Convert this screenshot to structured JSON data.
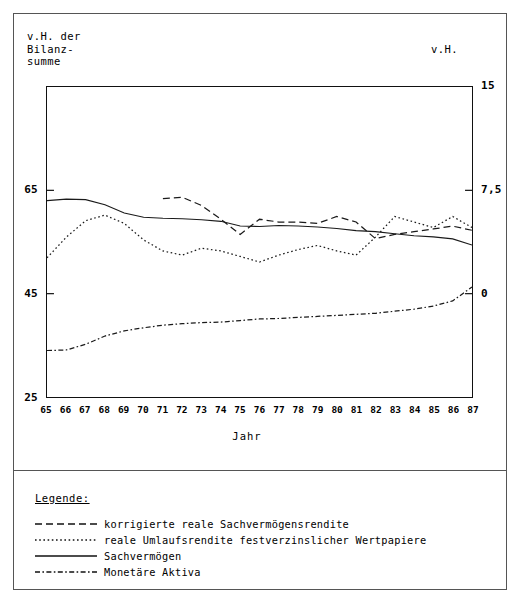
{
  "figure": {
    "left_axis_caption": "v.H. der\nBilanz-\nsumme",
    "right_axis_caption": "v.H."
  },
  "legend": {
    "title": "Legende:",
    "entries": [
      {
        "label": "korrigierte reale Sachvermögensrendite",
        "style": "dashed"
      },
      {
        "label": "reale Umlaufsrendite festverzinslicher Wertpapiere",
        "style": "dotted"
      },
      {
        "label": "Sachvermögen",
        "style": "solid"
      },
      {
        "label": "Monetäre Aktiva",
        "style": "dashdot"
      }
    ]
  },
  "chart_data": {
    "type": "line",
    "title": "",
    "xlabel": "Jahr",
    "ylabel": "v.H. der Bilanzsumme",
    "y2label": "v.H.",
    "grid": false,
    "legend_position": "below-plot",
    "x": [
      65,
      66,
      67,
      68,
      69,
      70,
      71,
      72,
      73,
      74,
      75,
      76,
      77,
      78,
      79,
      80,
      81,
      82,
      83,
      84,
      85,
      86,
      87
    ],
    "xtick_labels": [
      "65",
      "66",
      "67",
      "68",
      "69",
      "70",
      "71",
      "72",
      "73",
      "74",
      "75",
      "76",
      "77",
      "78",
      "79",
      "80",
      "81",
      "82",
      "83",
      "84",
      "85",
      "86",
      "87"
    ],
    "ylim": [
      25,
      85
    ],
    "yticks": [
      25,
      45,
      65,
      85
    ],
    "ytick_labels": [
      "25",
      "45",
      "65",
      ""
    ],
    "y2lim": [
      -7.5,
      15
    ],
    "y2ticks": [
      0,
      7.5,
      15
    ],
    "y2tick_labels": [
      "0",
      "7,5",
      "15"
    ],
    "series": [
      {
        "name": "korrigierte reale Sachvermögensrendite",
        "style": "dashed",
        "axis": "right",
        "x": [
          71,
          72,
          73,
          74,
          75,
          76,
          77,
          78,
          79,
          80,
          81,
          82,
          83,
          84,
          85,
          86,
          87
        ],
        "values": [
          6.9,
          7.0,
          6.4,
          5.4,
          4.3,
          5.4,
          5.2,
          5.2,
          5.1,
          5.6,
          5.2,
          4.0,
          4.3,
          4.5,
          4.7,
          4.9,
          4.6
        ]
      },
      {
        "name": "reale Umlaufsrendite festverzinslicher Wertpapiere",
        "style": "dotted",
        "axis": "right",
        "x": [
          65,
          66,
          67,
          68,
          69,
          70,
          71,
          72,
          73,
          74,
          75,
          76,
          77,
          78,
          79,
          80,
          81,
          82,
          83,
          84,
          85,
          86,
          87
        ],
        "values": [
          2.6,
          4.1,
          5.3,
          5.7,
          5.1,
          3.9,
          3.1,
          2.8,
          3.3,
          3.1,
          2.7,
          2.3,
          2.8,
          3.2,
          3.5,
          3.1,
          2.8,
          4.1,
          5.6,
          5.2,
          4.8,
          5.6,
          4.8
        ]
      },
      {
        "name": "Sachvermögen",
        "style": "solid",
        "axis": "left",
        "x": [
          65,
          66,
          67,
          68,
          69,
          70,
          71,
          72,
          73,
          74,
          75,
          76,
          77,
          78,
          79,
          80,
          81,
          82,
          83,
          84,
          85,
          86,
          87
        ],
        "values": [
          63.0,
          63.3,
          63.2,
          62.2,
          60.6,
          59.8,
          59.6,
          59.5,
          59.3,
          59.0,
          58.1,
          58.0,
          58.2,
          58.1,
          57.9,
          57.6,
          57.2,
          57.0,
          56.6,
          56.2,
          56.0,
          55.6,
          54.4
        ]
      },
      {
        "name": "Monetäre Aktiva",
        "style": "dashdot",
        "axis": "left",
        "x": [
          65,
          66,
          67,
          68,
          69,
          70,
          71,
          72,
          73,
          74,
          75,
          76,
          77,
          78,
          79,
          80,
          81,
          82,
          83,
          84,
          85,
          86,
          87
        ],
        "values": [
          34.0,
          34.1,
          35.2,
          36.8,
          37.8,
          38.4,
          38.9,
          39.2,
          39.4,
          39.5,
          39.8,
          40.1,
          40.2,
          40.4,
          40.6,
          40.8,
          41.0,
          41.2,
          41.6,
          42.0,
          42.6,
          43.6,
          46.3
        ]
      }
    ]
  }
}
